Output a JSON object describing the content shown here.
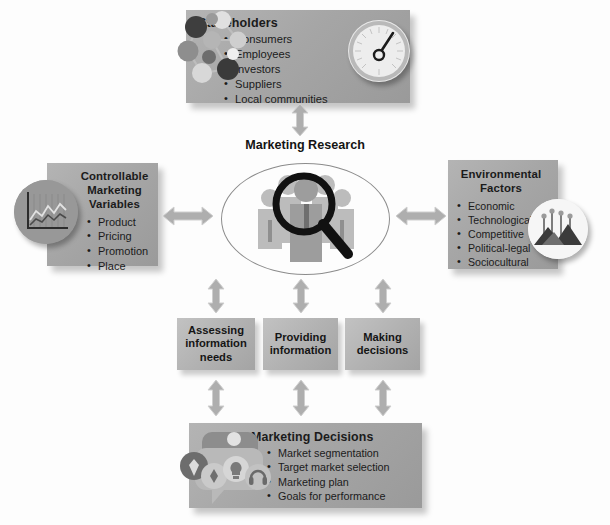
{
  "diagram": {
    "center": {
      "label": "Marketing Research",
      "icon": "crowd-magnifier-icon"
    },
    "nodes": {
      "stakeholders": {
        "title": "Stakeholders",
        "items": [
          "Consumers",
          "Employees",
          "Investors",
          "Suppliers",
          "Local communities"
        ],
        "icons": [
          "network-people-icon",
          "gauge-dial-icon"
        ]
      },
      "controllable": {
        "title": "Controllable\nMarketing\nVariables",
        "title_lines": [
          "Controllable",
          "Marketing",
          "Variables"
        ],
        "items": [
          "Product",
          "Pricing",
          "Promotion",
          "Place"
        ],
        "icons": [
          "line-chart-icon"
        ]
      },
      "environmental": {
        "title_lines": [
          "Environmental",
          "Factors"
        ],
        "items": [
          "Economic",
          "Technological",
          "Competitive",
          "Political-legal",
          "Sociocultural"
        ],
        "icons": [
          "mountain-flags-icon"
        ]
      },
      "decisions": {
        "title": "Marketing Decisions",
        "items": [
          "Market segmentation",
          "Target market selection",
          "Marketing plan",
          "Goals for performance"
        ],
        "icons": [
          "speech-bubbles-icon",
          "rocket-icon",
          "compass-icon",
          "lightbulb-icon",
          "headset-icon"
        ]
      }
    },
    "process_boxes": [
      {
        "id": "assessing",
        "lines": [
          "Assessing",
          "information",
          "needs"
        ]
      },
      {
        "id": "providing",
        "lines": [
          "Providing",
          "information"
        ]
      },
      {
        "id": "making",
        "lines": [
          "Making",
          "decisions"
        ]
      }
    ],
    "connectors": [
      {
        "name": "stakeholders-research",
        "direction": "bidirectional",
        "orientation": "vertical"
      },
      {
        "name": "controllable-research",
        "direction": "bidirectional",
        "orientation": "horizontal"
      },
      {
        "name": "environmental-research",
        "direction": "bidirectional",
        "orientation": "horizontal"
      },
      {
        "name": "research-assessing",
        "direction": "bidirectional",
        "orientation": "vertical"
      },
      {
        "name": "research-providing",
        "direction": "bidirectional",
        "orientation": "vertical"
      },
      {
        "name": "research-making",
        "direction": "bidirectional",
        "orientation": "vertical"
      },
      {
        "name": "assessing-decisions",
        "direction": "bidirectional",
        "orientation": "vertical"
      },
      {
        "name": "providing-decisions",
        "direction": "bidirectional",
        "orientation": "vertical"
      },
      {
        "name": "making-decisions",
        "direction": "bidirectional",
        "orientation": "vertical"
      }
    ],
    "colors": {
      "panel_fill": "#a6a6a6",
      "procbox_fill": "#b2b2b2",
      "arrow_fill": "#a9a9a9",
      "text": "#1b1b1b",
      "page_background": "#fdfdfd",
      "ellipse_stroke": "#8c8c8c"
    }
  }
}
